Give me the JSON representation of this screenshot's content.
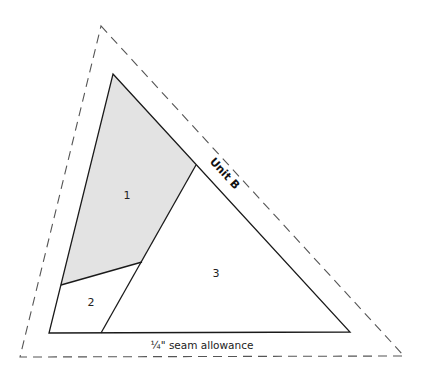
{
  "diagram": {
    "title": "Unit B",
    "caption": "¼\" seam allowance",
    "pieces": [
      {
        "label": "1",
        "shaded": true
      },
      {
        "label": "2",
        "shaded": false
      },
      {
        "label": "3",
        "shaded": false
      }
    ],
    "colors": {
      "shade": "#e3e3e3",
      "line": "#1a1a1a",
      "seam": "#555555"
    }
  }
}
